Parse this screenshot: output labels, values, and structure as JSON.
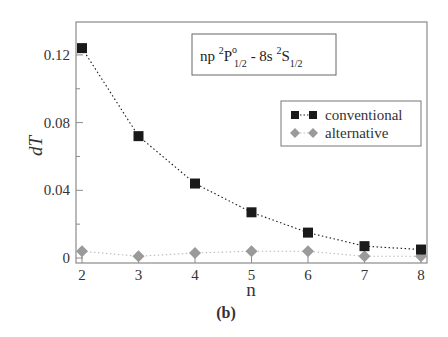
{
  "chart_data": {
    "type": "scatter",
    "title_parts": {
      "prefix": "np ",
      "sup1": "2",
      "main1": "P",
      "sup_o": "o",
      "sub1": "1/2",
      "mid": " - 8s ",
      "sup2": "2",
      "main2": "S",
      "sub2": "1/2"
    },
    "xlabel": "n",
    "ylabel": "dT",
    "caption": "(b)",
    "x": [
      2,
      3,
      4,
      5,
      6,
      7,
      8
    ],
    "xlim": [
      2,
      8
    ],
    "ylim": [
      -0.003,
      0.13
    ],
    "xticks": [
      "2",
      "3",
      "4",
      "5",
      "6",
      "7",
      "8"
    ],
    "yticks": [
      "0",
      "0.04",
      "0.08",
      "0.12"
    ],
    "ytick_values": [
      0,
      0.04,
      0.08,
      0.12
    ],
    "grid": false,
    "legend_position": "upper right",
    "series": [
      {
        "name": "conventional",
        "marker": "square",
        "line": "dotted",
        "color": "#1a1a1a",
        "values": [
          0.124,
          0.072,
          0.044,
          0.027,
          0.015,
          0.007,
          0.005
        ]
      },
      {
        "name": "alternative",
        "marker": "diamond",
        "line": "dotted",
        "color": "#999999",
        "values": [
          0.004,
          0.001,
          0.003,
          0.004,
          0.004,
          0.001,
          0.001
        ]
      }
    ]
  },
  "colors": {
    "axis": "#888888",
    "conventional": "#1a1a1a",
    "alternative": "#9a9a9a",
    "alternative_line": "#bbbbbb"
  }
}
